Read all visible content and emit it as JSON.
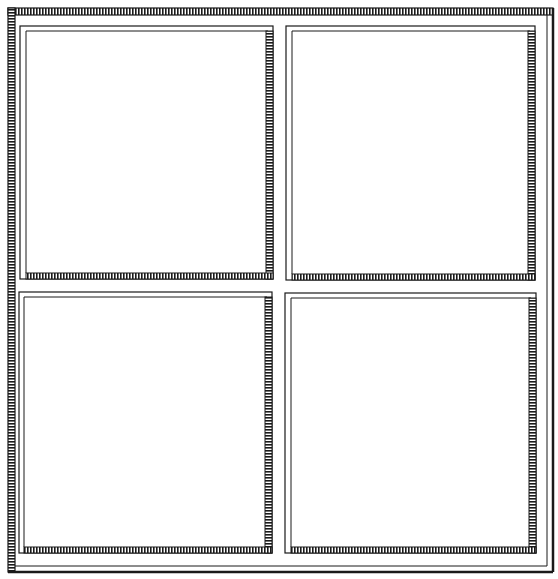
{
  "illustration": {
    "subject": "four-pane window frame line drawing",
    "stroke_color": "#1a1a1a",
    "background_color": "#ffffff",
    "panes": [
      {
        "id": "top-left"
      },
      {
        "id": "top-right"
      },
      {
        "id": "bottom-left"
      },
      {
        "id": "bottom-right"
      }
    ]
  }
}
